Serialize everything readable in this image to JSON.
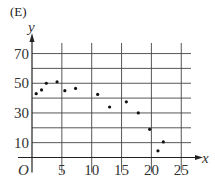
{
  "panel_label": "(E)",
  "chart_data": {
    "type": "scatter",
    "title": "",
    "xlabel": "x",
    "ylabel": "y",
    "origin_label": "O",
    "xlim": [
      0,
      26
    ],
    "ylim": [
      0,
      77
    ],
    "x_ticks": [
      5,
      10,
      15,
      20,
      25
    ],
    "y_ticks": [
      10,
      30,
      50,
      70
    ],
    "grid": true,
    "grid_x": [
      5,
      10,
      15,
      20,
      25
    ],
    "grid_y": [
      10,
      20,
      30,
      40,
      50,
      60,
      70
    ],
    "legend": null,
    "points": [
      {
        "x": 0.7,
        "y": 43
      },
      {
        "x": 1.6,
        "y": 45.5
      },
      {
        "x": 2.4,
        "y": 50
      },
      {
        "x": 4.2,
        "y": 51
      },
      {
        "x": 5.5,
        "y": 45
      },
      {
        "x": 7.3,
        "y": 46.5
      },
      {
        "x": 11,
        "y": 42.5
      },
      {
        "x": 13,
        "y": 34
      },
      {
        "x": 15.8,
        "y": 37.5
      },
      {
        "x": 17.8,
        "y": 30
      },
      {
        "x": 19.7,
        "y": 19
      },
      {
        "x": 21.1,
        "y": 4.5
      },
      {
        "x": 22,
        "y": 10.5
      }
    ]
  }
}
